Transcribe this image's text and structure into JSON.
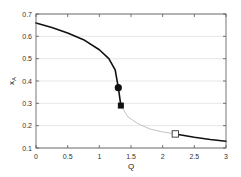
{
  "chart_data": {
    "type": "line",
    "title": "",
    "xlabel": "Q",
    "ylabel": "x_A",
    "xlim": [
      0,
      3
    ],
    "ylim": [
      0.1,
      0.7
    ],
    "xticks": [
      0,
      0.5,
      1,
      1.5,
      2,
      2.5,
      3
    ],
    "xtick_labels": [
      "0",
      "0.5",
      "1",
      "1.5",
      "2",
      "2.5",
      "3"
    ],
    "yticks": [
      0.1,
      0.2,
      0.3,
      0.4,
      0.5,
      0.6,
      0.7
    ],
    "ytick_labels": [
      "0.1",
      "0.2",
      "0.3",
      "0.4",
      "0.5",
      "0.6",
      "0.7"
    ],
    "grid": "horizontal",
    "legend": null,
    "series": [
      {
        "name": "stable upper branch",
        "style": "solid-black",
        "x": [
          0,
          0.25,
          0.5,
          0.75,
          1.0,
          1.15,
          1.25,
          1.3
        ],
        "y": [
          0.66,
          0.64,
          0.615,
          0.585,
          0.54,
          0.5,
          0.45,
          0.37
        ]
      },
      {
        "name": "vertical jump",
        "style": "solid-black",
        "x": [
          1.3,
          1.34
        ],
        "y": [
          0.37,
          0.29
        ]
      },
      {
        "name": "unstable middle branch",
        "style": "thin-gray",
        "x": [
          1.34,
          1.45,
          1.6,
          1.8,
          2.0,
          2.2
        ],
        "y": [
          0.29,
          0.24,
          0.21,
          0.185,
          0.172,
          0.163
        ]
      },
      {
        "name": "stable lower branch",
        "style": "solid-black",
        "x": [
          2.2,
          2.5,
          2.75,
          3.0
        ],
        "y": [
          0.163,
          0.148,
          0.138,
          0.13
        ]
      }
    ],
    "markers": [
      {
        "shape": "filled-circle",
        "x": 1.3,
        "y": 0.37
      },
      {
        "shape": "filled-square",
        "x": 1.34,
        "y": 0.29
      },
      {
        "shape": "open-square",
        "x": 2.2,
        "y": 0.163
      }
    ]
  },
  "layout": {
    "plot_left": 36,
    "plot_right": 226,
    "plot_top": 14,
    "plot_bottom": 148
  },
  "colors": {
    "axis": "#555555",
    "grid": "#e0e0e0",
    "stable": "#111111",
    "unstable": "#bbbbbb"
  }
}
